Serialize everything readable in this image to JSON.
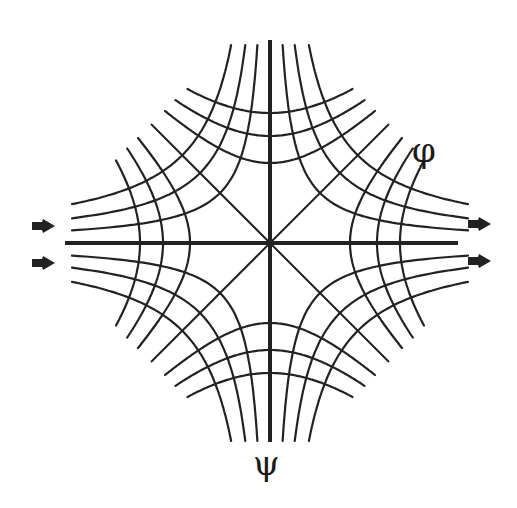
{
  "diagram": {
    "labels": {
      "phi": "φ",
      "psi": "ψ"
    },
    "colors": {
      "line": "#222222",
      "background": "#ffffff"
    },
    "center": [
      270,
      243
    ],
    "axes": {
      "horizontal": {
        "x1": 65,
        "x2": 458
      },
      "vertical": {
        "y1": 40,
        "y2": 442
      }
    },
    "diagonals_half_length": 55,
    "streamlines_xy_constants": [
      2500,
      4900,
      7700
    ],
    "streamline_extent": 198,
    "potential_constants": [
      6400,
      11450,
      16900
    ],
    "potential_inner_constants": [],
    "potential_truncation_sum": 238,
    "arrows": [
      {
        "name": "arrow-in-left-upper",
        "x": 42,
        "y": 226,
        "dir": "right"
      },
      {
        "name": "arrow-in-left-lower",
        "x": 42,
        "y": 263,
        "dir": "right"
      },
      {
        "name": "arrow-out-right-upper",
        "x": 478,
        "y": 224,
        "dir": "right"
      },
      {
        "name": "arrow-out-right-lower",
        "x": 478,
        "y": 261,
        "dir": "right"
      }
    ]
  }
}
